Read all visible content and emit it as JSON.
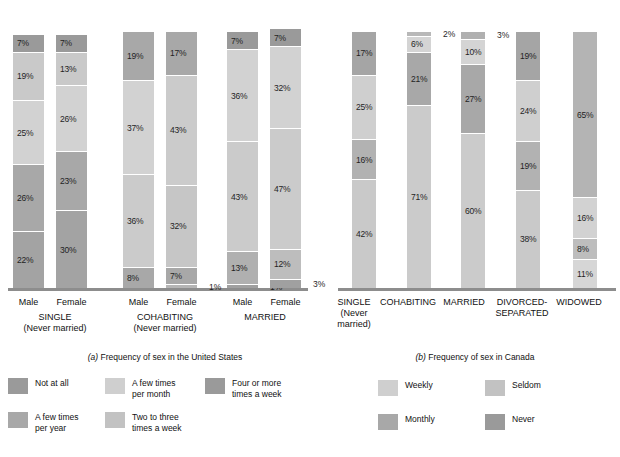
{
  "chart_data": [
    {
      "type": "bar",
      "id": "us",
      "title": "(a) Frequency of sex in the United States",
      "title_prefix": "(a)",
      "title_rest": " Frequency of sex in the United States",
      "stacked": true,
      "orientation": "vertical",
      "ylim": [
        0,
        100
      ],
      "ylabel": "",
      "xlabel": "",
      "grid": false,
      "legend_position": "bottom-left",
      "legend": [
        {
          "label": "Not at all",
          "color": "#9a9a9a"
        },
        {
          "label": "A few times\nper year",
          "color": "#a8a8a8"
        },
        {
          "label": "A few times\nper month",
          "color": "#cfcfcf"
        },
        {
          "label": "Two to three\ntimes a week",
          "color": "#c2c2c2"
        },
        {
          "label": "Four or more\ntimes a week",
          "color": "#9a9a9a"
        }
      ],
      "groups": [
        {
          "name": "SINGLE",
          "name_line2": "(Never married)",
          "bars": [
            {
              "label": "Male",
              "segments": [
                {
                  "category": "Four or more times a week",
                  "value": 7,
                  "text": "7%",
                  "color": "#9a9a9a",
                  "outside": false
                },
                {
                  "category": "Two to three times a week",
                  "value": 19,
                  "text": "19%",
                  "color": "#c9c9c9",
                  "outside": false
                },
                {
                  "category": "A few times per month",
                  "value": 25,
                  "text": "25%",
                  "color": "#d2d2d2",
                  "outside": false
                },
                {
                  "category": "A few times per year",
                  "value": 26,
                  "text": "26%",
                  "color": "#a8a8a8",
                  "outside": false
                },
                {
                  "category": "Not at all",
                  "value": 22,
                  "text": "22%",
                  "color": "#a3a3a3",
                  "outside": false
                }
              ]
            },
            {
              "label": "Female",
              "segments": [
                {
                  "category": "Four or more times a week",
                  "value": 7,
                  "text": "7%",
                  "color": "#9a9a9a",
                  "outside": false
                },
                {
                  "category": "Two to three times a week",
                  "value": 13,
                  "text": "13%",
                  "color": "#c9c9c9",
                  "outside": false
                },
                {
                  "category": "A few times per month",
                  "value": 26,
                  "text": "26%",
                  "color": "#d2d2d2",
                  "outside": false
                },
                {
                  "category": "A few times per year",
                  "value": 23,
                  "text": "23%",
                  "color": "#a8a8a8",
                  "outside": false
                },
                {
                  "category": "Not at all",
                  "value": 30,
                  "text": "30%",
                  "color": "#a3a3a3",
                  "outside": false
                }
              ]
            }
          ]
        },
        {
          "name": "COHABITING",
          "name_line2": "(Never married)",
          "bars": [
            {
              "label": "Male",
              "segments": [
                {
                  "category": "Four or more times a week",
                  "value": 19,
                  "text": "19%",
                  "color": "#a8a8a8",
                  "outside": false
                },
                {
                  "category": "Two to three times a week",
                  "value": 37,
                  "text": "37%",
                  "color": "#d2d2d2",
                  "outside": false
                },
                {
                  "category": "A few times per month",
                  "value": 36,
                  "text": "36%",
                  "color": "#cbcbcb",
                  "outside": false
                },
                {
                  "category": "A few times per year",
                  "value": 8,
                  "text": "8%",
                  "color": "#a8a8a8",
                  "outside": false
                }
              ]
            },
            {
              "label": "Female",
              "segments": [
                {
                  "category": "Four or more times a week",
                  "value": 17,
                  "text": "17%",
                  "color": "#a8a8a8",
                  "outside": false
                },
                {
                  "category": "Two to three times a week",
                  "value": 43,
                  "text": "43%",
                  "color": "#cbcbcb",
                  "outside": false
                },
                {
                  "category": "A few times per month",
                  "value": 32,
                  "text": "32%",
                  "color": "#c6c6c6",
                  "outside": false
                },
                {
                  "category": "A few times per year",
                  "value": 7,
                  "text": "7%",
                  "color": "#a8a8a8",
                  "outside": false
                },
                {
                  "category": "Not at all",
                  "value": 1,
                  "text": "1%",
                  "color": "#b5b5b5",
                  "outside": true
                }
              ]
            }
          ]
        },
        {
          "name": "MARRIED",
          "name_line2": "",
          "bars": [
            {
              "label": "Male",
              "segments": [
                {
                  "category": "Four or more times a week",
                  "value": 7,
                  "text": "7%",
                  "color": "#9a9a9a",
                  "outside": false
                },
                {
                  "category": "Two to three times a week",
                  "value": 36,
                  "text": "36%",
                  "color": "#d2d2d2",
                  "outside": false
                },
                {
                  "category": "A few times per month",
                  "value": 43,
                  "text": "43%",
                  "color": "#cbcbcb",
                  "outside": false
                },
                {
                  "category": "A few times per year",
                  "value": 13,
                  "text": "13%",
                  "color": "#b0b0b0",
                  "outside": false
                },
                {
                  "category": "Not at all",
                  "value": 1,
                  "text": "1%",
                  "color": "#a0a0a0",
                  "outside": true
                }
              ]
            },
            {
              "label": "Female",
              "segments": [
                {
                  "category": "Four or more times a week",
                  "value": 7,
                  "text": "7%",
                  "color": "#9a9a9a",
                  "outside": false
                },
                {
                  "category": "Two to three times a week",
                  "value": 32,
                  "text": "32%",
                  "color": "#d2d2d2",
                  "outside": false
                },
                {
                  "category": "A few times per month",
                  "value": 47,
                  "text": "47%",
                  "color": "#cbcbcb",
                  "outside": false
                },
                {
                  "category": "A few times per year",
                  "value": 12,
                  "text": "12%",
                  "color": "#bdbdbd",
                  "outside": false
                },
                {
                  "category": "Not at all",
                  "value": 3,
                  "text": "3%",
                  "color": "#a0a0a0",
                  "outside": true
                }
              ]
            }
          ]
        }
      ]
    },
    {
      "type": "bar",
      "id": "ca",
      "title": "(b) Frequency of sex in Canada",
      "title_prefix": "(b)",
      "title_rest": " Frequency of sex in Canada",
      "stacked": true,
      "orientation": "vertical",
      "ylim": [
        0,
        100
      ],
      "ylabel": "",
      "xlabel": "",
      "grid": false,
      "legend_position": "bottom-center",
      "legend": [
        {
          "label": "Weekly",
          "color": "#cfcfcf"
        },
        {
          "label": "Seldom",
          "color": "#c2c2c2"
        },
        {
          "label": "Monthly",
          "color": "#a8a8a8"
        },
        {
          "label": "Never",
          "color": "#9a9a9a"
        }
      ],
      "groups": [
        {
          "name": "SINGLE",
          "name_line2": "(Never",
          "name_line3": "married)",
          "bars": [
            {
              "label": "",
              "segments": [
                {
                  "category": "Never",
                  "value": 17,
                  "text": "17%",
                  "color": "#a5a5a5",
                  "outside": false
                },
                {
                  "category": "Seldom",
                  "value": 25,
                  "text": "25%",
                  "color": "#cfcfcf",
                  "outside": false
                },
                {
                  "category": "Monthly",
                  "value": 16,
                  "text": "16%",
                  "color": "#b2b2b2",
                  "outside": false
                },
                {
                  "category": "Weekly",
                  "value": 42,
                  "text": "42%",
                  "color": "#c9c9c9",
                  "outside": false
                }
              ]
            }
          ]
        },
        {
          "name": "COHABITING",
          "name_line2": "",
          "bars": [
            {
              "label": "",
              "segments": [
                {
                  "category": "Never",
                  "value": 2,
                  "text": "2%",
                  "color": "#b8b8b8",
                  "outside": true
                },
                {
                  "category": "Seldom",
                  "value": 6,
                  "text": "6%",
                  "color": "#d4d4d4",
                  "outside": false
                },
                {
                  "category": "Monthly",
                  "value": 21,
                  "text": "21%",
                  "color": "#a8a8a8",
                  "outside": false
                },
                {
                  "category": "Weekly",
                  "value": 71,
                  "text": "71%",
                  "color": "#cbcbcb",
                  "outside": false
                }
              ]
            }
          ]
        },
        {
          "name": "MARRIED",
          "name_line2": "",
          "bars": [
            {
              "label": "",
              "segments": [
                {
                  "category": "Never",
                  "value": 3,
                  "text": "3%",
                  "color": "#b0b0b0",
                  "outside": true
                },
                {
                  "category": "Seldom",
                  "value": 10,
                  "text": "10%",
                  "color": "#d4d4d4",
                  "outside": false
                },
                {
                  "category": "Monthly",
                  "value": 27,
                  "text": "27%",
                  "color": "#a8a8a8",
                  "outside": false
                },
                {
                  "category": "Weekly",
                  "value": 60,
                  "text": "60%",
                  "color": "#cbcbcb",
                  "outside": false
                }
              ]
            }
          ]
        },
        {
          "name": "DIVORCED-",
          "name_line2": "SEPARATED",
          "bars": [
            {
              "label": "",
              "segments": [
                {
                  "category": "Never",
                  "value": 19,
                  "text": "19%",
                  "color": "#a5a5a5",
                  "outside": false
                },
                {
                  "category": "Seldom",
                  "value": 24,
                  "text": "24%",
                  "color": "#cfcfcf",
                  "outside": false
                },
                {
                  "category": "Monthly",
                  "value": 19,
                  "text": "19%",
                  "color": "#b2b2b2",
                  "outside": false
                },
                {
                  "category": "Weekly",
                  "value": 38,
                  "text": "38%",
                  "color": "#c9c9c9",
                  "outside": false
                }
              ]
            }
          ]
        },
        {
          "name": "WIDOWED",
          "name_line2": "",
          "bars": [
            {
              "label": "",
              "segments": [
                {
                  "category": "Never",
                  "value": 65,
                  "text": "65%",
                  "color": "#b4b4b4",
                  "outside": false
                },
                {
                  "category": "Seldom",
                  "value": 16,
                  "text": "16%",
                  "color": "#d2d2d2",
                  "outside": false
                },
                {
                  "category": "Monthly",
                  "value": 8,
                  "text": "8%",
                  "color": "#bdbdbd",
                  "outside": false
                },
                {
                  "category": "Weekly",
                  "value": 11,
                  "text": "11%",
                  "color": "#d6d6d6",
                  "outside": false
                }
              ]
            }
          ]
        }
      ]
    }
  ]
}
